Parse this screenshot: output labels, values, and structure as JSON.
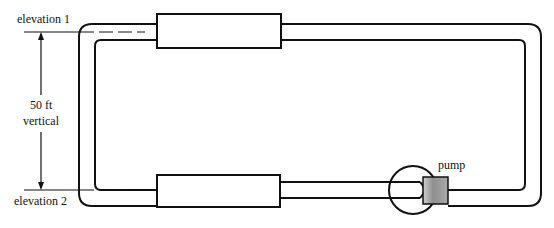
{
  "labels": {
    "elevation_1": "elevation 1",
    "elevation_2": "elevation 2",
    "height_value": "50 ft",
    "height_desc": "vertical",
    "pump": "pump"
  },
  "colors": {
    "line": "#111111",
    "pump_shade": "#9a9a9a",
    "background": "#ffffff"
  }
}
